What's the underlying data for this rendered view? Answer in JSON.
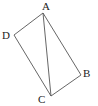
{
  "figure": {
    "type": "quadrilateral-with-diagonal",
    "stroke_color": "#555555",
    "label_color": "#222222",
    "points": {
      "A": {
        "label": "A",
        "x": 43,
        "y": 13,
        "lx": 42,
        "ly": 10
      },
      "B": {
        "label": "B",
        "x": 81,
        "y": 75,
        "lx": 83,
        "ly": 77
      },
      "C": {
        "label": "C",
        "x": 51,
        "y": 96,
        "lx": 38,
        "ly": 103
      },
      "D": {
        "label": "D",
        "x": 14,
        "y": 35,
        "lx": 2,
        "ly": 39
      }
    },
    "segments": [
      {
        "name": "AB",
        "from": "A",
        "to": "B"
      },
      {
        "name": "BC",
        "from": "B",
        "to": "C"
      },
      {
        "name": "CD",
        "from": "C",
        "to": "D"
      },
      {
        "name": "DA",
        "from": "D",
        "to": "A"
      },
      {
        "name": "AC",
        "from": "A",
        "to": "C"
      }
    ]
  }
}
